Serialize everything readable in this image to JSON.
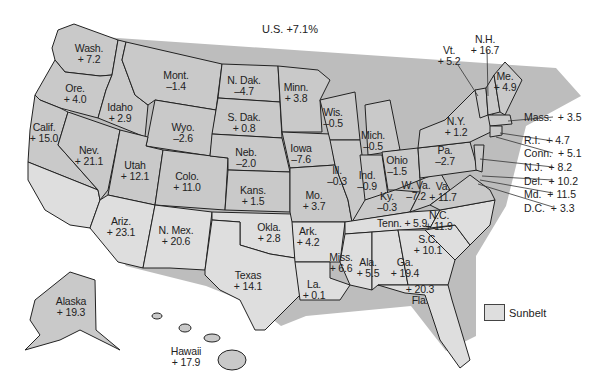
{
  "title": "U.S.  +7.1%",
  "legend": {
    "label": "Sunbelt",
    "color": "#dedede",
    "non_sunbelt_color": "#c9c9c9"
  },
  "states": [
    {
      "name": "Wash.",
      "value": "+ 7.2",
      "sunbelt": false
    },
    {
      "name": "Ore.",
      "value": "+ 4.0",
      "sunbelt": false
    },
    {
      "name": "Calif.",
      "value": "+ 15.0",
      "sunbelt": true
    },
    {
      "name": "Idaho",
      "value": "+ 2.9",
      "sunbelt": false
    },
    {
      "name": "Nev.",
      "value": "+ 21.1",
      "sunbelt": false
    },
    {
      "name": "Mont.",
      "value": "–1.4",
      "sunbelt": false
    },
    {
      "name": "Wyo.",
      "value": "–2.6",
      "sunbelt": false
    },
    {
      "name": "Utah",
      "value": "+ 12.1",
      "sunbelt": false
    },
    {
      "name": "Colo.",
      "value": "+ 11.0",
      "sunbelt": false
    },
    {
      "name": "Ariz.",
      "value": "+ 23.1",
      "sunbelt": true
    },
    {
      "name": "N. Mex.",
      "value": "+ 20.6",
      "sunbelt": true
    },
    {
      "name": "N. Dak.",
      "value": "–4.7",
      "sunbelt": false
    },
    {
      "name": "S. Dak.",
      "value": "+ 0.8",
      "sunbelt": false
    },
    {
      "name": "Neb.",
      "value": "–2.0",
      "sunbelt": false
    },
    {
      "name": "Kans.",
      "value": "+ 1.5",
      "sunbelt": false
    },
    {
      "name": "Okla.",
      "value": "+ 2.8",
      "sunbelt": true
    },
    {
      "name": "Texas",
      "value": "+ 14.1",
      "sunbelt": true
    },
    {
      "name": "Minn.",
      "value": "+ 3.8",
      "sunbelt": false
    },
    {
      "name": "Iowa",
      "value": "–7.6",
      "sunbelt": false
    },
    {
      "name": "Mo.",
      "value": "+ 3.7",
      "sunbelt": false
    },
    {
      "name": "Ark.",
      "value": "+ 4.2",
      "sunbelt": true
    },
    {
      "name": "La.",
      "value": "+ 0.1",
      "sunbelt": true
    },
    {
      "name": "Wis.",
      "value": "–0.5",
      "sunbelt": false
    },
    {
      "name": "Ill.",
      "value": "–0.3",
      "sunbelt": false
    },
    {
      "name": "Mich.",
      "value": "–0.5",
      "sunbelt": false
    },
    {
      "name": "Ind.",
      "value": "–0.9",
      "sunbelt": false
    },
    {
      "name": "Ohio",
      "value": "–1.5",
      "sunbelt": false
    },
    {
      "name": "Ky.",
      "value": "–0.3",
      "sunbelt": false
    },
    {
      "name": "Tenn.",
      "value": "+ 5.9",
      "sunbelt": true
    },
    {
      "name": "Miss.",
      "value": "+ 6.6",
      "sunbelt": true
    },
    {
      "name": "Ala.",
      "value": "+ 5.5",
      "sunbelt": true
    },
    {
      "name": "Ga.",
      "value": "+ 19.4",
      "sunbelt": true
    },
    {
      "name": "Fla.",
      "value": "+ 20.3",
      "sunbelt": true
    },
    {
      "name": "S.C.",
      "value": "+ 10.1",
      "sunbelt": true
    },
    {
      "name": "N.C.",
      "value": "+ 11.9",
      "sunbelt": true
    },
    {
      "name": "Va.",
      "value": "+ 11.7",
      "sunbelt": false
    },
    {
      "name": "W. Va.",
      "value": "–7.2",
      "sunbelt": false
    },
    {
      "name": "Pa.",
      "value": "–2.7",
      "sunbelt": false
    },
    {
      "name": "N.Y.",
      "value": "+ 1.2",
      "sunbelt": false
    },
    {
      "name": "Vt.",
      "value": "+ 5.2",
      "sunbelt": false
    },
    {
      "name": "N.H.",
      "value": "+ 16.7",
      "sunbelt": false
    },
    {
      "name": "Me.",
      "value": "+ 4.9",
      "sunbelt": false
    },
    {
      "name": "Mass.",
      "value": "+ 3.5",
      "sunbelt": false
    },
    {
      "name": "R.I.",
      "value": "+ 4.7",
      "sunbelt": false
    },
    {
      "name": "Conn.",
      "value": "+ 5.1",
      "sunbelt": false
    },
    {
      "name": "N.J.",
      "value": "+ 8.2",
      "sunbelt": false
    },
    {
      "name": "Del.",
      "value": "+ 10.2",
      "sunbelt": false
    },
    {
      "name": "Md.",
      "value": "+ 11.5",
      "sunbelt": false
    },
    {
      "name": "D.C.",
      "value": "+ 3.3",
      "sunbelt": false
    },
    {
      "name": "Alaska",
      "value": "+ 19.3",
      "sunbelt": false
    },
    {
      "name": "Hawaii",
      "value": "+ 17.9",
      "sunbelt": false
    }
  ]
}
